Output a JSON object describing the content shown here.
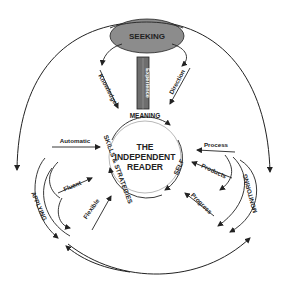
{
  "diagram": {
    "title": [
      "THE",
      "INDEPENDENT",
      "READER"
    ],
    "colors": {
      "ink": "#222222",
      "seeking_fill": "#8c8c8c",
      "experience_fill": "#6e6e6e",
      "background": "#ffffff"
    },
    "top_node": {
      "label": "SEEKING",
      "shape": "oval"
    },
    "experience_bar": {
      "label": "Experience"
    },
    "inner_ring_labels": {
      "top": "MEANING",
      "left": "SKILLS & STRATEGIES",
      "right": "SELF"
    },
    "seeking_branch": {
      "left": "Knowledge",
      "right": "Direction"
    },
    "applying_branch": {
      "label": "APPLYING",
      "items": [
        "Automatic",
        "Fluent",
        "Flexible"
      ]
    },
    "monitoring_branch": {
      "label": "MONITORING",
      "items": [
        "Process",
        "Products",
        "Progress"
      ]
    }
  }
}
